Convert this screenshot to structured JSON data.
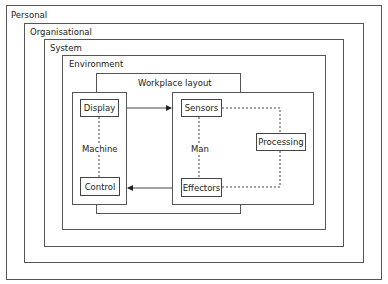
{
  "diagram": {
    "layers": [
      {
        "id": "personal",
        "label": "Personal"
      },
      {
        "id": "organisational",
        "label": "Organisational"
      },
      {
        "id": "system",
        "label": "System"
      },
      {
        "id": "environment",
        "label": "Environment"
      },
      {
        "id": "workplace",
        "label": "Workplace layout"
      }
    ],
    "machine": {
      "label": "Machine",
      "nodes": [
        {
          "id": "display",
          "label": "Display"
        },
        {
          "id": "control",
          "label": "Control"
        }
      ]
    },
    "man": {
      "label": "Man",
      "nodes": [
        {
          "id": "sensors",
          "label": "Sensors"
        },
        {
          "id": "processing",
          "label": "Processing"
        },
        {
          "id": "effectors",
          "label": "Effectors"
        }
      ]
    },
    "edges": [
      {
        "from": "Display",
        "to": "Sensors",
        "style": "solid-arrow"
      },
      {
        "from": "Effectors",
        "to": "Control",
        "style": "solid-arrow"
      },
      {
        "from": "Display",
        "to": "Control",
        "style": "dashed"
      },
      {
        "from": "Sensors",
        "to": "Effectors",
        "style": "dashed"
      },
      {
        "from": "Sensors",
        "to": "Processing",
        "style": "dashed"
      },
      {
        "from": "Processing",
        "to": "Effectors",
        "style": "dashed"
      }
    ]
  }
}
